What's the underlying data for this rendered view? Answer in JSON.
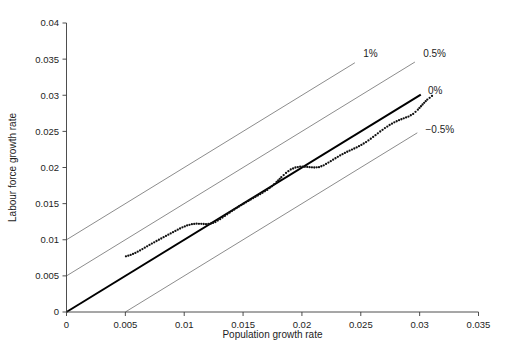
{
  "figure": {
    "background_color": "#ffffff",
    "width": 508,
    "height": 354
  },
  "caption": {
    "text": ""
  },
  "chart_data": {
    "type": "line",
    "title": "",
    "subtitle": "",
    "xlabel": "Population growth rate",
    "ylabel": "Labour force growth rate",
    "xlim": [
      0,
      0.035
    ],
    "ylim": [
      0,
      0.04
    ],
    "xticks": [
      0,
      0.005,
      0.01,
      0.015,
      0.02,
      0.025,
      0.03,
      0.035
    ],
    "xticklabels": [
      "0",
      "0.005",
      "0.01",
      "0.015",
      "0.02",
      "0.025",
      "0.03",
      "0.035"
    ],
    "yticks": [
      0,
      0.005,
      0.01,
      0.015,
      0.02,
      0.025,
      0.03,
      0.035,
      0.04
    ],
    "yticklabels": [
      "0",
      "0.005",
      "0.01",
      "0.015",
      "0.02",
      "0.025",
      "0.03",
      "0.035",
      "0.04"
    ],
    "grid": false,
    "legend": "inline-line-labels",
    "reference_lines": [
      {
        "name": "one-percent",
        "label": "1%",
        "slope": 1,
        "intercept": 0.01,
        "style": "thin",
        "color": "#6f6f6f",
        "x_start": 0,
        "x_end": 0.0245,
        "label_x": 0.0252,
        "label_y": 0.0358
      },
      {
        "name": "half-percent",
        "label": "0.5%",
        "slope": 1,
        "intercept": 0.005,
        "style": "thin",
        "color": "#6f6f6f",
        "x_start": 0,
        "x_end": 0.0296,
        "label_x": 0.0303,
        "label_y": 0.0358
      },
      {
        "name": "zero-percent",
        "label": "0%",
        "slope": 1,
        "intercept": 0,
        "style": "bold",
        "color": "#000000",
        "x_start": 0,
        "x_end": 0.0301,
        "label_x": 0.0307,
        "label_y": 0.0307
      },
      {
        "name": "minus-half-percent",
        "label": "−0.5%",
        "slope": 1,
        "intercept": -0.005,
        "style": "thin",
        "color": "#6f6f6f",
        "x_start": 0.005,
        "x_end": 0.0298,
        "label_x": 0.0305,
        "label_y": 0.0252
      }
    ],
    "series": [
      {
        "name": "observed-path",
        "label": "",
        "style": "dotted",
        "color": "#111111",
        "marker": "dot",
        "x": [
          0.00505,
          0.00545,
          0.00585,
          0.00625,
          0.00665,
          0.00705,
          0.00745,
          0.00785,
          0.00825,
          0.00865,
          0.00905,
          0.00945,
          0.00985,
          0.01025,
          0.01065,
          0.01105,
          0.01145,
          0.01185,
          0.01225,
          0.01265,
          0.01305,
          0.01345,
          0.01385,
          0.01425,
          0.01465,
          0.01505,
          0.01545,
          0.01585,
          0.01625,
          0.01665,
          0.01705,
          0.01745,
          0.01785,
          0.01825,
          0.01865,
          0.01905,
          0.01945,
          0.01985,
          0.02025,
          0.02065,
          0.02105,
          0.02145,
          0.02185,
          0.02225,
          0.02265,
          0.02305,
          0.02345,
          0.02385,
          0.02425,
          0.02465,
          0.02505,
          0.02545,
          0.02585,
          0.02625,
          0.02665,
          0.02705,
          0.02745,
          0.02785,
          0.02825,
          0.02865,
          0.02905,
          0.02945,
          0.02985,
          0.03025,
          0.03065,
          0.03105
        ],
        "y": [
          0.0077,
          0.0079,
          0.00818,
          0.00852,
          0.0089,
          0.00928,
          0.00965,
          0.01,
          0.01035,
          0.0107,
          0.01105,
          0.0114,
          0.01172,
          0.01198,
          0.01215,
          0.01222,
          0.0122,
          0.01216,
          0.01222,
          0.01245,
          0.01285,
          0.0133,
          0.01375,
          0.01418,
          0.0146,
          0.015,
          0.01538,
          0.01575,
          0.01612,
          0.0165,
          0.0169,
          0.0174,
          0.018,
          0.01865,
          0.01925,
          0.01972,
          0.02,
          0.02012,
          0.0201,
          0.02005,
          0.02,
          0.02005,
          0.0203,
          0.02068,
          0.02108,
          0.02148,
          0.02185,
          0.02218,
          0.02248,
          0.02278,
          0.02312,
          0.02352,
          0.02398,
          0.02448,
          0.02498,
          0.02545,
          0.02588,
          0.02625,
          0.02655,
          0.0268,
          0.02705,
          0.02742,
          0.028,
          0.02872,
          0.0294,
          0.0299
        ]
      }
    ]
  }
}
